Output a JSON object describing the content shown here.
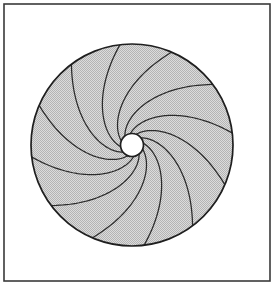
{
  "figure": {
    "kind": "spiral-disk-diagram",
    "canvas": {
      "width": 276,
      "height": 290,
      "background_color": "#ffffff"
    },
    "frame": {
      "name": "border-frame",
      "x": 4,
      "y": 4,
      "width": 266,
      "height": 277,
      "stroke_color": "#3a3a3a",
      "stroke_width": 1.6,
      "fill": "none"
    },
    "disk": {
      "name": "shaded-disk",
      "center_x": 132,
      "center_y": 145,
      "outer_radius": 101,
      "inner_radius": 11.5,
      "fill_color": "#c9c9c9",
      "fill_pattern": "halftone-dither",
      "outline_color": "#1f1f1f",
      "outline_width": 1.7
    },
    "hole": {
      "name": "center-hole",
      "center_x": 132,
      "center_y": 145,
      "radius": 11.5,
      "fill_color": "#ffffff",
      "outline_color": "#1f1f1f",
      "outline_width": 1.7
    },
    "spirals": {
      "name": "spiral-arm-set",
      "count": 12,
      "direction": "clockwise-outward",
      "sweep_degrees": 92,
      "stroke_color": "#2b2b2b",
      "stroke_width": 1.25,
      "start_angle_offset_degrees": -8
    }
  },
  "chart_data": {
    "type": "scatter",
    "xlabel": "",
    "ylabel": "",
    "grid": false,
    "legend": "none",
    "series": [
      {
        "name": "outer-circle",
        "radius": 101,
        "center": [
          132,
          145
        ]
      },
      {
        "name": "inner-circle",
        "radius": 11.5,
        "center": [
          132,
          145
        ]
      },
      {
        "name": "spiral-arms",
        "count": 12,
        "angles_degrees": [
          -8,
          22,
          52,
          82,
          112,
          142,
          172,
          202,
          232,
          262,
          292,
          322
        ],
        "r_start": 11.5,
        "r_end": 101,
        "sweep_degrees": 92
      }
    ]
  }
}
